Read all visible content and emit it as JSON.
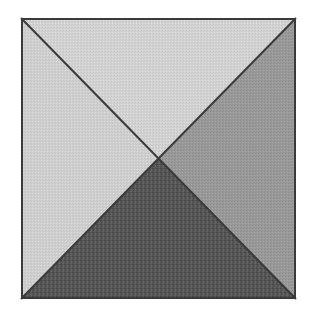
{
  "figure": {
    "title": "Square divided by two diagonals into four shaded triangles",
    "canvas": {
      "width": 312,
      "height": 315,
      "background_color": "#ffffff"
    },
    "square": {
      "label": "Outer square outline",
      "left": 21,
      "top": 18,
      "right": 296,
      "bottom": 299,
      "width": 275,
      "height": 281,
      "border_color": "#3a3a3a",
      "border_width": 2
    },
    "center_point": {
      "label": "Diagonal intersection",
      "x": 158.5,
      "y": 158.5
    },
    "diagonals": [
      {
        "name": "diagonal-top-left-to-bottom-right",
        "x1": 21,
        "y1": 18,
        "x2": 296,
        "y2": 299,
        "color": "#3a3a3a",
        "width": 2
      },
      {
        "name": "diagonal-top-right-to-bottom-left",
        "x1": 296,
        "y1": 18,
        "x2": 21,
        "y2": 299,
        "color": "#3a3a3a",
        "width": 2
      }
    ],
    "regions": [
      {
        "name": "top-triangle",
        "label": "Top triangle",
        "fill_color": "#d2d2d2",
        "tone": "light gray",
        "points": "21,18 296,18 158.5,158.5",
        "texture": "halftone-fine"
      },
      {
        "name": "left-triangle",
        "label": "Left triangle",
        "fill_color": "#cfcfcf",
        "tone": "light gray",
        "points": "21,18 158.5,158.5 21,299",
        "texture": "halftone-fine"
      },
      {
        "name": "right-triangle",
        "label": "Right triangle",
        "fill_color": "#999999",
        "tone": "medium gray",
        "points": "296,18 296,299 158.5,158.5",
        "texture": "halftone-fine"
      },
      {
        "name": "bottom-triangle",
        "label": "Bottom triangle",
        "fill_color": "#555555",
        "tone": "dark gray",
        "points": "21,299 296,299 158.5,158.5",
        "texture": "halftone-coarse"
      }
    ]
  }
}
